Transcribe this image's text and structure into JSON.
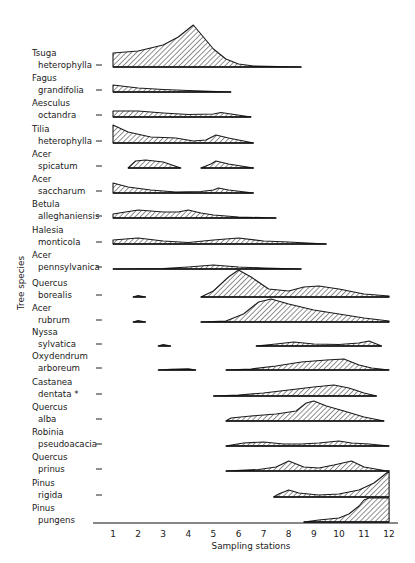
{
  "chart_data": {
    "type": "area",
    "subtype": "kite-diagram",
    "title": "",
    "xlabel": "Sampling stations",
    "ylabel": "Tree species",
    "x_ticks": [
      1,
      2,
      3,
      4,
      5,
      6,
      7,
      8,
      9,
      10,
      11,
      12
    ],
    "xlim": [
      0.3,
      12.3
    ],
    "grid": false,
    "legend": null,
    "note": "Relative abundance profiles (filled hatched areas) per species along sampling stations; heights in relative units (px-scale).",
    "series": [
      {
        "name": "Tsuga heterophylla",
        "label_lines": [
          "Tsuga",
          "heterophylla"
        ],
        "segments": [
          [
            [
              1.0,
              14
            ],
            [
              2.0,
              16
            ],
            [
              3.0,
              22
            ],
            [
              3.6,
              30
            ],
            [
              4.2,
              42
            ],
            [
              4.6,
              30
            ],
            [
              5.0,
              18
            ],
            [
              5.5,
              8
            ],
            [
              6.0,
              3
            ],
            [
              6.6,
              1
            ],
            [
              8.5,
              0
            ]
          ]
        ]
      },
      {
        "name": "Fagus grandifolia",
        "label_lines": [
          "Fagus",
          "grandifolia"
        ],
        "segments": [
          [
            [
              1.0,
              7
            ],
            [
              2.0,
              4
            ],
            [
              3.0,
              2.5
            ],
            [
              4.0,
              1.5
            ],
            [
              5.7,
              0
            ]
          ]
        ]
      },
      {
        "name": "Aesculus octandra",
        "label_lines": [
          "Aesculus",
          "octandra"
        ],
        "segments": [
          [
            [
              1.0,
              6
            ],
            [
              2.0,
              6
            ],
            [
              3.0,
              4
            ],
            [
              4.0,
              2.5
            ],
            [
              5.0,
              3
            ],
            [
              5.3,
              4.5
            ],
            [
              5.7,
              3
            ],
            [
              6.5,
              0
            ]
          ]
        ]
      },
      {
        "name": "Tilia heterophylla",
        "label_lines": [
          "Tilia",
          "heterophylla"
        ],
        "segments": [
          [
            [
              1.0,
              18
            ],
            [
              1.6,
              11
            ],
            [
              2.5,
              6
            ],
            [
              3.5,
              5
            ],
            [
              4.2,
              2
            ],
            [
              4.7,
              3
            ],
            [
              5.1,
              8
            ],
            [
              5.6,
              5
            ],
            [
              6.6,
              0
            ]
          ]
        ]
      },
      {
        "name": "Acer spicatum",
        "label_lines": [
          "Acer",
          "spicatum"
        ],
        "segments": [
          [
            [
              1.6,
              0
            ],
            [
              1.9,
              7
            ],
            [
              2.3,
              8
            ],
            [
              3.0,
              6
            ],
            [
              3.7,
              0
            ]
          ],
          [
            [
              4.5,
              0
            ],
            [
              4.9,
              4
            ],
            [
              5.1,
              7
            ],
            [
              5.6,
              4
            ],
            [
              6.6,
              0
            ]
          ]
        ]
      },
      {
        "name": "Acer saccharum",
        "label_lines": [
          "Acer",
          "saccharum"
        ],
        "segments": [
          [
            [
              1.0,
              10
            ],
            [
              1.6,
              6
            ],
            [
              2.5,
              3
            ],
            [
              3.5,
              1
            ],
            [
              4.5,
              1.5
            ],
            [
              5.0,
              3
            ],
            [
              5.2,
              5
            ],
            [
              5.6,
              3
            ],
            [
              6.6,
              0
            ]
          ]
        ]
      },
      {
        "name": "Betula alleghaniensis",
        "label_lines": [
          "Betula",
          "alleghaniensis"
        ],
        "segments": [
          [
            [
              1.0,
              4
            ],
            [
              2.0,
              8
            ],
            [
              3.0,
              6
            ],
            [
              3.6,
              6
            ],
            [
              4.0,
              8
            ],
            [
              4.5,
              5
            ],
            [
              5.0,
              3
            ],
            [
              6.0,
              1
            ],
            [
              7.5,
              0
            ]
          ]
        ]
      },
      {
        "name": "Halesia monticola",
        "label_lines": [
          "Halesia",
          "monticola"
        ],
        "segments": [
          [
            [
              1.0,
              4
            ],
            [
              2.0,
              6
            ],
            [
              3.0,
              3
            ],
            [
              4.0,
              1.5
            ],
            [
              5.0,
              4
            ],
            [
              6.0,
              6
            ],
            [
              7.0,
              3
            ],
            [
              8.0,
              2
            ],
            [
              9.5,
              0
            ]
          ]
        ]
      },
      {
        "name": "Acer pennsylvanica",
        "label_lines": [
          "Acer",
          "pennsylvanica"
        ],
        "segments": [
          [
            [
              1.0,
              0
            ],
            [
              3.0,
              0.5
            ],
            [
              4.0,
              2
            ],
            [
              5.0,
              4
            ],
            [
              6.0,
              2
            ],
            [
              7.0,
              1
            ],
            [
              8.5,
              0
            ]
          ]
        ]
      },
      {
        "name": "Quercus borealis",
        "label_lines": [
          "Quercus",
          "borealis"
        ],
        "segments": [
          [
            [
              1.8,
              0
            ],
            [
              2.0,
              1.5
            ],
            [
              2.3,
              0
            ]
          ],
          [
            [
              4.5,
              0
            ],
            [
              5.0,
              6
            ],
            [
              5.6,
              20
            ],
            [
              6.0,
              27
            ],
            [
              6.5,
              20
            ],
            [
              7.2,
              8
            ],
            [
              8.0,
              6
            ],
            [
              8.6,
              10
            ],
            [
              9.2,
              11
            ],
            [
              10.0,
              8
            ],
            [
              11.0,
              3
            ],
            [
              12.0,
              1
            ]
          ]
        ]
      },
      {
        "name": "Acer rubrum",
        "label_lines": [
          "Acer",
          "rubrum"
        ],
        "segments": [
          [
            [
              1.8,
              0
            ],
            [
              2.0,
              1.5
            ],
            [
              2.3,
              0
            ]
          ],
          [
            [
              4.5,
              0
            ],
            [
              5.5,
              1
            ],
            [
              6.2,
              8
            ],
            [
              6.8,
              20
            ],
            [
              7.3,
              23
            ],
            [
              8.0,
              18
            ],
            [
              9.0,
              12
            ],
            [
              10.0,
              8
            ],
            [
              11.0,
              4
            ],
            [
              12.0,
              1
            ]
          ]
        ]
      },
      {
        "name": "Nyssa sylvatica",
        "label_lines": [
          "Nyssa",
          "sylvatica"
        ],
        "segments": [
          [
            [
              2.8,
              0
            ],
            [
              3.0,
              1.5
            ],
            [
              3.3,
              0
            ]
          ],
          [
            [
              6.7,
              0
            ],
            [
              7.5,
              2
            ],
            [
              8.2,
              4
            ],
            [
              9.0,
              2
            ],
            [
              10.0,
              1.5
            ],
            [
              10.8,
              3
            ],
            [
              11.2,
              5
            ],
            [
              11.7,
              0
            ]
          ]
        ]
      },
      {
        "name": "Oxydendrum arboreum",
        "label_lines": [
          "Oxydendrum",
          "arboreum"
        ],
        "segments": [
          [
            [
              2.8,
              0
            ],
            [
              3.3,
              0.8
            ],
            [
              4.0,
              1.2
            ],
            [
              4.3,
              0
            ]
          ],
          [
            [
              5.5,
              0
            ],
            [
              6.5,
              1
            ],
            [
              7.5,
              4
            ],
            [
              8.5,
              8
            ],
            [
              9.5,
              10
            ],
            [
              10.2,
              11
            ],
            [
              10.8,
              5
            ],
            [
              11.3,
              2
            ],
            [
              12.0,
              0
            ]
          ]
        ]
      },
      {
        "name": "Castanea dentata",
        "label_lines": [
          "Castanea",
          "dentata"
        ],
        "marker": "*",
        "segments": [
          [
            [
              5.0,
              0
            ],
            [
              6.0,
              1
            ],
            [
              7.0,
              3
            ],
            [
              8.0,
              6
            ],
            [
              9.0,
              9
            ],
            [
              9.8,
              11
            ],
            [
              10.4,
              8
            ],
            [
              11.0,
              3
            ],
            [
              11.5,
              0
            ]
          ]
        ]
      },
      {
        "name": "Quercus alba",
        "label_lines": [
          "Quercus",
          "alba"
        ],
        "segments": [
          [
            [
              5.5,
              0
            ],
            [
              5.7,
              3
            ],
            [
              6.5,
              5
            ],
            [
              7.5,
              7
            ],
            [
              8.3,
              10
            ],
            [
              8.7,
              18
            ],
            [
              9.0,
              20
            ],
            [
              9.5,
              15
            ],
            [
              10.2,
              10
            ],
            [
              11.0,
              4
            ],
            [
              11.8,
              0
            ]
          ]
        ]
      },
      {
        "name": "Robinia pseudoacacia",
        "label_lines": [
          "Robinia",
          "pseudoacacia"
        ],
        "segments": [
          [
            [
              5.5,
              0
            ],
            [
              6.2,
              3
            ],
            [
              7.0,
              4
            ],
            [
              7.8,
              2
            ],
            [
              8.5,
              2
            ],
            [
              9.2,
              3
            ],
            [
              10.0,
              5
            ],
            [
              10.5,
              3
            ],
            [
              11.2,
              2
            ],
            [
              12.0,
              0
            ]
          ]
        ]
      },
      {
        "name": "Quercus prinus",
        "label_lines": [
          "Quercus",
          "prinus"
        ],
        "segments": [
          [
            [
              5.5,
              0
            ],
            [
              6.8,
              1.5
            ],
            [
              7.5,
              4
            ],
            [
              8.0,
              10
            ],
            [
              8.6,
              4
            ],
            [
              9.2,
              3
            ],
            [
              9.8,
              6
            ],
            [
              10.5,
              10
            ],
            [
              11.0,
              4
            ],
            [
              11.8,
              0.5
            ],
            [
              12.0,
              0
            ]
          ]
        ]
      },
      {
        "name": "Pinus rigida",
        "label_lines": [
          "Pinus",
          "rigida"
        ],
        "segments": [
          [
            [
              7.4,
              0
            ],
            [
              7.6,
              3
            ],
            [
              8.0,
              7
            ],
            [
              8.4,
              4
            ],
            [
              9.2,
              2
            ],
            [
              10.0,
              3
            ],
            [
              10.8,
              7
            ],
            [
              11.4,
              14
            ],
            [
              11.8,
              22
            ],
            [
              12.0,
              26
            ],
            [
              12.0,
              0
            ]
          ]
        ]
      },
      {
        "name": "Pinus pungens",
        "label_lines": [
          "Pinus",
          "pungens"
        ],
        "segments": [
          [
            [
              8.6,
              0
            ],
            [
              9.2,
              2
            ],
            [
              10.0,
              4
            ],
            [
              10.4,
              8
            ],
            [
              10.8,
              16
            ],
            [
              11.0,
              22
            ],
            [
              11.2,
              24
            ],
            [
              12.0,
              24
            ],
            [
              12.0,
              0
            ]
          ]
        ]
      }
    ]
  }
}
